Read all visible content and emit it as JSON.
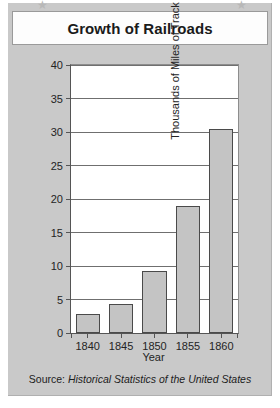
{
  "decorations": {
    "star_glyph": "★",
    "star_left_name": "star-left",
    "star_right_name": "star-right"
  },
  "header": {
    "title": "Growth of Railroads"
  },
  "source": {
    "prefix": "Source:",
    "publication": "Historical Statistics of the United States"
  },
  "colors": {
    "panel_background": "#c9c9c9",
    "plot_background": "#ffffff",
    "bar_fill": "#c4c4c4",
    "bar_outline": "#4a4a4a",
    "gridline": "#6f6f6f",
    "axis": "#555555",
    "text": "#242424",
    "star": "#b8b8b8"
  },
  "chart_data": {
    "type": "bar",
    "title": "Growth of Railroads",
    "xlabel": "Year",
    "ylabel": "Thousands of Miles of Track",
    "categories": [
      "1840",
      "1845",
      "1850",
      "1855",
      "1860"
    ],
    "values": [
      2.8,
      4.3,
      9.2,
      19.0,
      30.5
    ],
    "ylim": [
      0,
      40
    ],
    "yticks": [
      0,
      5,
      10,
      15,
      20,
      25,
      30,
      35,
      40
    ],
    "ytick_labels": [
      "0",
      "5",
      "10",
      "15",
      "20",
      "25",
      "30",
      "35",
      "40"
    ],
    "grid": true,
    "legend": false,
    "source": "Source: Historical Statistics of the United States"
  }
}
